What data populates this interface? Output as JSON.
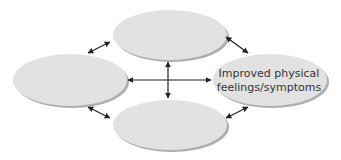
{
  "diagram": {
    "type": "cycle-network",
    "colors": {
      "node_fill": "#e2e2e2",
      "node_shadow": "#9a9a9a",
      "arrow": "#222222",
      "text": "#333333",
      "background": "#ffffff"
    },
    "nodes": [
      {
        "id": "top",
        "label_lines": [
          "",
          ""
        ],
        "cx": 170,
        "cy": 35,
        "rx": 57,
        "ry": 25
      },
      {
        "id": "left",
        "label_lines": [
          "",
          ""
        ],
        "cx": 70,
        "cy": 80,
        "rx": 57,
        "ry": 26
      },
      {
        "id": "right",
        "label_lines": [
          "Improved physical",
          "feelings/symptoms"
        ],
        "cx": 270,
        "cy": 80,
        "rx": 57,
        "ry": 26
      },
      {
        "id": "bottom",
        "label_lines": [
          "",
          ""
        ],
        "cx": 170,
        "cy": 125,
        "rx": 57,
        "ry": 25
      }
    ],
    "edges": [
      {
        "from": "left",
        "to": "right",
        "bidirectional": true
      },
      {
        "from": "top",
        "to": "bottom",
        "bidirectional": true
      },
      {
        "from": "left",
        "to": "top",
        "bidirectional": true
      },
      {
        "from": "top",
        "to": "right",
        "bidirectional": true
      },
      {
        "from": "left",
        "to": "bottom",
        "bidirectional": true
      },
      {
        "from": "bottom",
        "to": "right",
        "bidirectional": true
      }
    ]
  }
}
